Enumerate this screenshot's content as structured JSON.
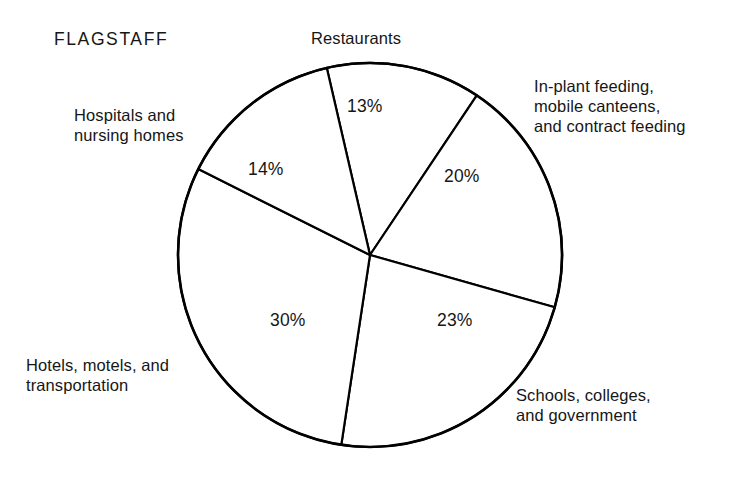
{
  "chart_data": {
    "type": "pie",
    "title": "FLAGSTAFF",
    "xlabel": "",
    "ylabel": "",
    "legend_position": "outside-labels",
    "grid": false,
    "center": {
      "x": 370,
      "y": 255
    },
    "radius": 192,
    "start_angle_deg": -103,
    "direction": "clockwise",
    "categories": [
      "Restaurants",
      "In-plant feeding, mobile canteens, and contract feeding",
      "Schools, colleges, and government",
      "Hotels, motels, and transportation",
      "Hospitals and nursing homes"
    ],
    "values": [
      13,
      20,
      23,
      30,
      14
    ],
    "value_labels": [
      "13%",
      "20%",
      "23%",
      "30%",
      "14%"
    ],
    "slices": [
      {
        "key": "restaurants",
        "label": "Restaurants",
        "label_lines": [
          "Restaurants"
        ],
        "value": 13,
        "value_label": "13%",
        "fill": "#ffffff",
        "stroke": "#000000"
      },
      {
        "key": "inplant",
        "label": "In-plant feeding, mobile canteens, and contract feeding",
        "label_lines": [
          "In-plant feeding,",
          "mobile canteens,",
          "and contract feeding"
        ],
        "value": 20,
        "value_label": "20%",
        "fill": "#ffffff",
        "stroke": "#000000"
      },
      {
        "key": "schools",
        "label": "Schools, colleges, and government",
        "label_lines": [
          "Schools, colleges,",
          "and government"
        ],
        "value": 23,
        "value_label": "23%",
        "fill": "#ffffff",
        "stroke": "#000000"
      },
      {
        "key": "hotels",
        "label": "Hotels, motels, and transportation",
        "label_lines": [
          "Hotels, motels, and",
          "transportation"
        ],
        "value": 30,
        "value_label": "30%",
        "fill": "#ffffff",
        "stroke": "#000000"
      },
      {
        "key": "hospitals",
        "label": "Hospitals and nursing homes",
        "label_lines": [
          "Hospitals and",
          "nursing homes"
        ],
        "value": 14,
        "value_label": "14%",
        "fill": "#ffffff",
        "stroke": "#000000"
      }
    ],
    "total": 100,
    "units": "percent"
  },
  "figure": {
    "background": "#ffffff",
    "line_color": "#000000",
    "text_color": "#161616"
  }
}
